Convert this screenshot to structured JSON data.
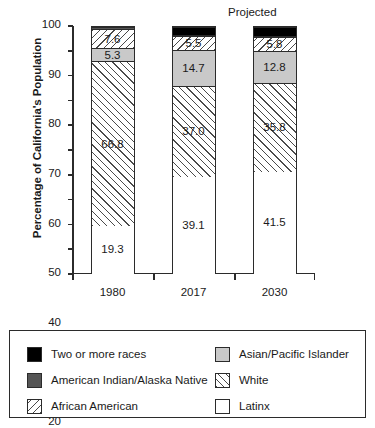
{
  "chart_data": {
    "type": "bar",
    "subtype": "stacked-bar-100",
    "title": "",
    "xlabel": "",
    "ylabel": "Percentage of California's Population",
    "categories": [
      "1980",
      "2017",
      "2030"
    ],
    "ylim": [
      0,
      100
    ],
    "ytick_labels": [
      "0",
      "10",
      "20",
      "30",
      "40",
      "50",
      "60",
      "70",
      "80",
      "90",
      "100"
    ],
    "ytick_values": [
      0,
      10,
      20,
      30,
      40,
      50,
      60,
      70,
      80,
      90,
      100
    ],
    "grid": false,
    "legend_position": "below",
    "annotations": [
      {
        "text": "Projected",
        "target_category": "2030"
      }
    ],
    "series": [
      {
        "name": "Latinx",
        "fill": "white",
        "values": [
          19.3,
          39.1,
          41.5
        ],
        "labels": [
          "19.3",
          "39.1",
          "41.5"
        ]
      },
      {
        "name": "White",
        "fill": "forward-hatch",
        "values": [
          66.8,
          37.0,
          35.8
        ],
        "labels": [
          "66.8",
          "37.0",
          "35.8"
        ]
      },
      {
        "name": "Asian/Pacific Islander",
        "fill": "light-gray",
        "values": [
          5.3,
          14.7,
          12.8
        ],
        "labels": [
          "5.3",
          "14.7",
          "12.8"
        ]
      },
      {
        "name": "African American",
        "fill": "back-hatch",
        "values": [
          7.6,
          5.5,
          5.8
        ],
        "labels": [
          "7.6",
          "5.5",
          "5.8"
        ]
      },
      {
        "name": "American Indian/Alaska Native",
        "fill": "dark-gray",
        "values": [
          1.0,
          0.5,
          0.4
        ],
        "labels": [
          "",
          "",
          ""
        ]
      },
      {
        "name": "Two or more races",
        "fill": "black",
        "values": [
          0.0,
          3.2,
          3.7
        ],
        "labels": [
          "",
          "",
          ""
        ]
      }
    ]
  },
  "legend": {
    "left_column": [
      {
        "label": "Two or more races",
        "fill": "black"
      },
      {
        "label": "American Indian/Alaska Native",
        "fill": "dark-gray"
      },
      {
        "label": "African American",
        "fill": "back-hatch"
      }
    ],
    "right_column": [
      {
        "label": "Asian/Pacific Islander",
        "fill": "light-gray"
      },
      {
        "label": "White",
        "fill": "forward-hatch"
      },
      {
        "label": "Latinx",
        "fill": "white"
      }
    ]
  },
  "colors": {
    "axis": "#2b2b2b",
    "black_fill": "#000000",
    "dark_gray_fill": "#555555",
    "light_gray_fill": "#c9c9c9",
    "white_fill": "#ffffff",
    "hatch_line": "#4a4a4a"
  }
}
